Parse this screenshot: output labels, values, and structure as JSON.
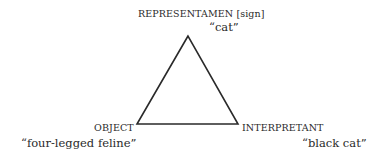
{
  "diagram": {
    "nodes": {
      "top": {
        "label": "REPRESENTAMEN [sign]",
        "example": "“cat”"
      },
      "left": {
        "label": "OBJECT",
        "example": "“four-legged feline”"
      },
      "right": {
        "label": "INTERPRETANT",
        "example": "“black cat”"
      }
    },
    "edges": [
      [
        "top",
        "left"
      ],
      [
        "top",
        "right"
      ],
      [
        "left",
        "right"
      ]
    ],
    "colors": {
      "line": "#2a2a2a",
      "text": "#2a2a2a",
      "background": "#ffffff"
    }
  }
}
